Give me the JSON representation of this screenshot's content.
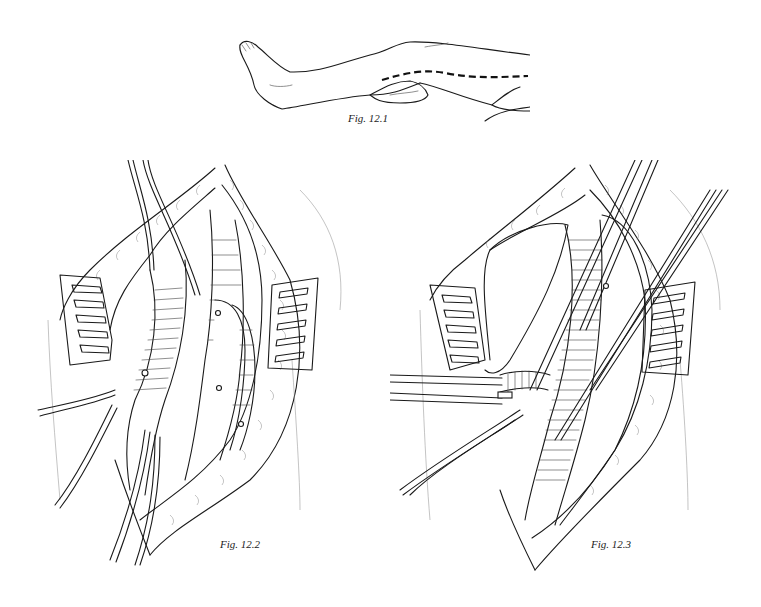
{
  "figures": [
    {
      "id": "fig-12-1",
      "caption": "Fig. 12.1",
      "description": "Leg lying supine with dashed incision line along the medial thigh"
    },
    {
      "id": "fig-12-2",
      "caption": "Fig. 12.2",
      "description": "Open surgical exposure held by two retractors; vessels elevated with vessel loops"
    },
    {
      "id": "fig-12-3",
      "caption": "Fig. 12.3",
      "description": "Open surgical exposure held by two retractors; main vessel with branch controlled by loops"
    }
  ],
  "colors": {
    "background": "#ffffff",
    "ink": "#1a1a1a"
  }
}
